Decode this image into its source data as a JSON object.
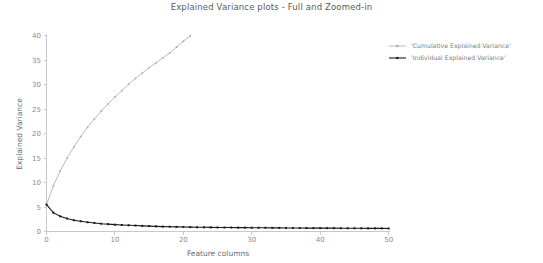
{
  "chart_data": {
    "type": "line",
    "title": "Explained Variance plots - Full and Zoomed-in",
    "xlabel": "Feature columns",
    "ylabel": "Explained Variance",
    "xlim": [
      0,
      51
    ],
    "ylim": [
      0,
      41
    ],
    "xticks": [
      0,
      10,
      20,
      30,
      40,
      50
    ],
    "yticks": [
      0,
      5,
      10,
      15,
      20,
      25,
      30,
      35,
      40
    ],
    "grid": false,
    "legend_position": "upper right outside",
    "series": [
      {
        "name": "'Cumulative Explained Variance'",
        "color": "#a9a9a9",
        "marker": "square",
        "x": [
          0,
          1,
          2,
          3,
          4,
          5,
          6,
          7,
          8,
          9,
          10,
          11,
          12,
          13,
          14,
          15,
          16,
          17,
          18,
          19,
          20,
          21
        ],
        "values": [
          5.5,
          9.3,
          12.4,
          15.0,
          17.3,
          19.4,
          21.3,
          23.0,
          24.6,
          26.1,
          27.5,
          28.8,
          30.1,
          31.3,
          32.4,
          33.5,
          34.5,
          35.5,
          36.5,
          37.7,
          38.9,
          40.0
        ]
      },
      {
        "name": "'Individual Explained Variance'",
        "color": "#1a1a1a",
        "marker": "square",
        "x": [
          0,
          1,
          2,
          3,
          4,
          5,
          6,
          7,
          8,
          9,
          10,
          11,
          12,
          13,
          14,
          15,
          16,
          17,
          18,
          19,
          20,
          21,
          22,
          23,
          24,
          25,
          26,
          27,
          28,
          29,
          30,
          31,
          32,
          33,
          34,
          35,
          36,
          37,
          38,
          39,
          40,
          41,
          42,
          43,
          44,
          45,
          46,
          47,
          48,
          49,
          50
        ],
        "values": [
          5.5,
          3.85,
          3.1,
          2.65,
          2.3,
          2.1,
          1.9,
          1.75,
          1.6,
          1.5,
          1.4,
          1.33,
          1.28,
          1.22,
          1.15,
          1.1,
          1.05,
          1.0,
          0.98,
          0.95,
          0.93,
          0.9,
          0.88,
          0.86,
          0.84,
          0.83,
          0.82,
          0.81,
          0.8,
          0.79,
          0.78,
          0.77,
          0.76,
          0.75,
          0.74,
          0.73,
          0.72,
          0.71,
          0.7,
          0.7,
          0.69,
          0.68,
          0.68,
          0.67,
          0.66,
          0.66,
          0.65,
          0.64,
          0.64,
          0.63,
          0.62
        ]
      }
    ]
  },
  "legend": {
    "entries": [
      {
        "label": "'Cumulative Explained Variance'",
        "color": "#a9a9a9"
      },
      {
        "label": "'Individual Explained Variance'",
        "color": "#1a1a1a"
      }
    ]
  },
  "axes": {
    "x_tick_labels": [
      "0",
      "10",
      "20",
      "30",
      "40",
      "50"
    ],
    "y_tick_labels": [
      "0",
      "5",
      "10",
      "15",
      "20",
      "25",
      "30",
      "35",
      "40"
    ]
  }
}
